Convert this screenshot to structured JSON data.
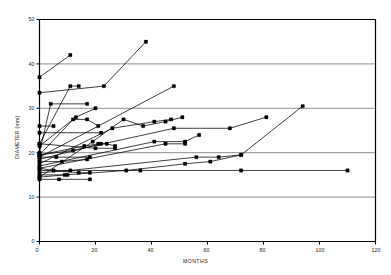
{
  "chart_data": {
    "type": "line",
    "title": "",
    "xlabel": "MONTHS",
    "ylabel": "DIAMETER (mm)",
    "xlim": [
      0,
      120
    ],
    "ylim": [
      0,
      50
    ],
    "xticks": [
      0,
      20,
      40,
      60,
      80,
      100,
      120
    ],
    "yticks": [
      0,
      10,
      20,
      30,
      40,
      50
    ],
    "grid": "horizontal",
    "legend": "none",
    "marker": "filled-square",
    "marker_color": "#000000",
    "line_color": "#000000",
    "grid_color": "#808080",
    "frame_color": "#000000",
    "series": [
      {
        "name": "s1",
        "x": [
          0,
          11
        ],
        "y": [
          37.0,
          42.0
        ]
      },
      {
        "name": "s2",
        "x": [
          0,
          23,
          38
        ],
        "y": [
          33.5,
          35.0,
          45.0
        ]
      },
      {
        "name": "s3",
        "x": [
          0,
          11,
          14
        ],
        "y": [
          22.0,
          35.0,
          35.0
        ]
      },
      {
        "name": "s4",
        "x": [
          0,
          4,
          17
        ],
        "y": [
          20.0,
          31.0,
          31.0
        ]
      },
      {
        "name": "s5",
        "x": [
          0,
          13,
          20
        ],
        "y": [
          21.5,
          28.0,
          30.0
        ]
      },
      {
        "name": "s6",
        "x": [
          0,
          12,
          17,
          21
        ],
        "y": [
          19.5,
          27.5,
          27.5,
          26.0
        ]
      },
      {
        "name": "s7",
        "x": [
          0,
          5
        ],
        "y": [
          26.0,
          26.0
        ]
      },
      {
        "name": "s8",
        "x": [
          0,
          19,
          30,
          37,
          45,
          51
        ],
        "y": [
          14.5,
          22.5,
          27.5,
          26.0,
          27.0,
          28.0
        ]
      },
      {
        "name": "s9",
        "x": [
          0,
          26,
          41,
          47
        ],
        "y": [
          17.5,
          25.5,
          27.0,
          27.5
        ]
      },
      {
        "name": "s10",
        "x": [
          0,
          48
        ],
        "y": [
          19.0,
          35.0
        ]
      },
      {
        "name": "s11",
        "x": [
          0,
          16,
          21
        ],
        "y": [
          19.5,
          21.5,
          22.0
        ]
      },
      {
        "name": "s12",
        "x": [
          0,
          22,
          24,
          27
        ],
        "y": [
          18.5,
          22.0,
          22.0,
          21.5
        ]
      },
      {
        "name": "s13",
        "x": [
          0,
          41,
          52,
          57
        ],
        "y": [
          17.0,
          22.5,
          22.5,
          24.0
        ]
      },
      {
        "name": "s14",
        "x": [
          0,
          45,
          52
        ],
        "y": [
          16.5,
          22.0,
          22.0
        ]
      },
      {
        "name": "s15",
        "x": [
          0,
          6,
          18
        ],
        "y": [
          19.0,
          19.0,
          19.0
        ]
      },
      {
        "name": "s16",
        "x": [
          0,
          8,
          17
        ],
        "y": [
          18.0,
          18.0,
          18.5
        ]
      },
      {
        "name": "s17",
        "x": [
          0,
          11,
          56,
          64,
          72
        ],
        "y": [
          15.5,
          16.0,
          19.0,
          19.0,
          19.5
        ]
      },
      {
        "name": "s18",
        "x": [
          0,
          5,
          14,
          18
        ],
        "y": [
          16.5,
          16.0,
          15.5,
          15.5
        ]
      },
      {
        "name": "s19",
        "x": [
          0,
          9,
          31,
          52,
          61,
          72,
          94
        ],
        "y": [
          14.5,
          15.0,
          16.0,
          17.5,
          18.0,
          19.5,
          30.5
        ]
      },
      {
        "name": "s20",
        "x": [
          0,
          7,
          18
        ],
        "y": [
          14.0,
          14.0,
          14.0
        ]
      },
      {
        "name": "s21",
        "x": [
          0,
          10
        ],
        "y": [
          15.0,
          15.0
        ]
      },
      {
        "name": "s22",
        "x": [
          0,
          36,
          72,
          110
        ],
        "y": [
          16.0,
          16.0,
          16.0,
          16.0
        ]
      },
      {
        "name": "s23",
        "x": [
          0,
          12,
          48,
          68,
          81
        ],
        "y": [
          19.5,
          20.5,
          25.5,
          25.5,
          28.0
        ]
      },
      {
        "name": "s24",
        "x": [
          0,
          22
        ],
        "y": [
          24.5,
          24.5
        ]
      },
      {
        "name": "s25",
        "x": [
          0,
          20,
          27
        ],
        "y": [
          22.0,
          21.0,
          21.0
        ]
      }
    ]
  },
  "axis_labels": {
    "y": [
      "0",
      "10",
      "20",
      "30",
      "40",
      "50"
    ],
    "x": [
      "0",
      "20",
      "40",
      "60",
      "80",
      "100",
      "120"
    ],
    "ytitle": "DIAMETER (mm)",
    "xtitle": "MONTHS"
  }
}
